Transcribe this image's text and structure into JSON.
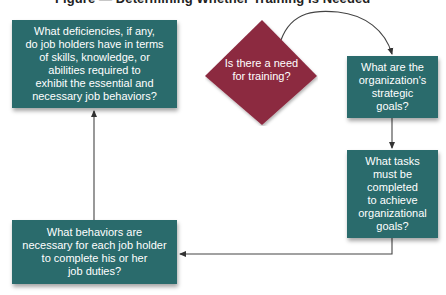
{
  "title": "Figure — Determining Whether Training Is Needed",
  "colors": {
    "box": "#2a6b6c",
    "decision": "#8c2a40",
    "connector": "#444444",
    "text": "#ffffff"
  },
  "decision": {
    "label": "Is there a need for training?",
    "line1": "Is there a need",
    "line2": "for training?"
  },
  "steps": [
    {
      "id": "strategic-goals",
      "label": "What are the organization's strategic goals?",
      "lines": [
        "What are the",
        "organization's",
        "strategic",
        "goals?"
      ]
    },
    {
      "id": "tasks",
      "label": "What tasks must be completed to achieve organizational goals?",
      "lines": [
        "What tasks",
        "must be",
        "completed",
        "to achieve",
        "organizational",
        "goals?"
      ]
    },
    {
      "id": "behaviors",
      "label": "What behaviors are necessary for each job holder to complete his or her job duties?",
      "lines": [
        "What behaviors are",
        "necessary for each job holder",
        "to complete his or her",
        "job duties?"
      ]
    },
    {
      "id": "deficiencies",
      "label": "What deficiencies, if any, do job holders have in terms of skills, knowledge, or abilities required to exhibit the essential and necessary job behaviors?",
      "lines": [
        "What deficiencies, if any,",
        "do job holders have in terms",
        "of skills, knowledge, or",
        "abilities required to",
        "exhibit the essential and",
        "necessary job behaviors?"
      ]
    }
  ],
  "flow": [
    {
      "from": "decision",
      "to": "strategic-goals",
      "type": "curved-arrow"
    },
    {
      "from": "strategic-goals",
      "to": "tasks",
      "type": "arrow"
    },
    {
      "from": "tasks",
      "to": "behaviors",
      "type": "elbow-arrow"
    },
    {
      "from": "behaviors",
      "to": "deficiencies",
      "type": "arrow"
    }
  ]
}
